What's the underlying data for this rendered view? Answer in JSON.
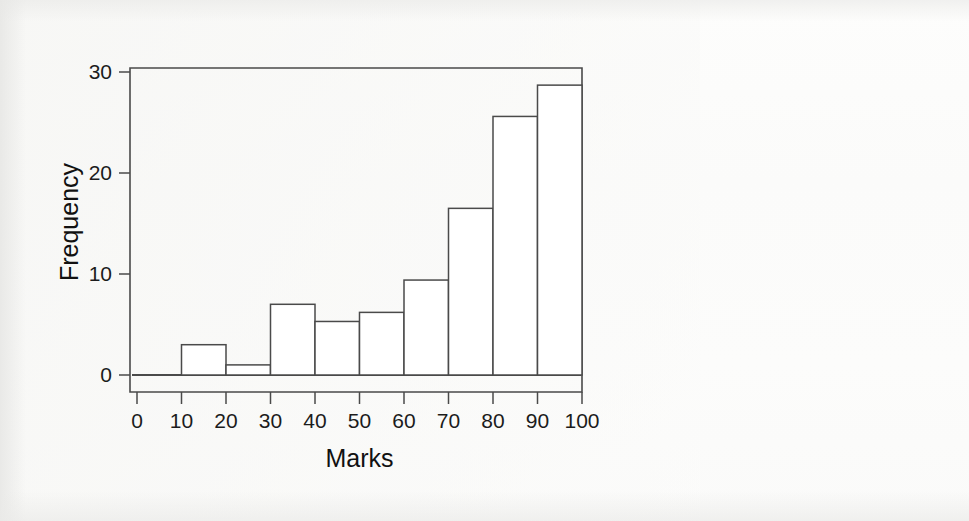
{
  "figure": {
    "background_color": "#fcfcfb",
    "ink_color": "#3a3a3a",
    "text_color": "#1c1c1c"
  },
  "chart_data": {
    "type": "bar",
    "title": "",
    "subtitle": "",
    "xlabel": "Marks",
    "ylabel": "Frequency",
    "xlim": [
      0,
      100
    ],
    "ylim": [
      0,
      30
    ],
    "grid": false,
    "legend": false,
    "legend_position": "none",
    "bin_width": 10,
    "bin_edges": [
      0,
      10,
      20,
      30,
      40,
      50,
      60,
      70,
      80,
      90,
      100
    ],
    "categories": [
      "0-10",
      "10-20",
      "20-30",
      "30-40",
      "40-50",
      "50-60",
      "60-70",
      "70-80",
      "80-90",
      "90-100"
    ],
    "values": [
      0,
      3,
      1,
      7,
      5.3,
      6.2,
      9.4,
      16.5,
      25.6,
      28.7
    ],
    "xticks": [
      0,
      10,
      20,
      30,
      40,
      50,
      60,
      70,
      80,
      90,
      100
    ],
    "xtick_labels": [
      "0",
      "10",
      "20",
      "30",
      "40",
      "50",
      "60",
      "70",
      "80",
      "90",
      "100"
    ],
    "yticks": [
      0,
      10,
      20,
      30
    ],
    "ytick_labels": [
      "0",
      "10",
      "20",
      "30"
    ],
    "bar_fill": "#ffffff",
    "bar_edge": "#4a4a4a"
  }
}
